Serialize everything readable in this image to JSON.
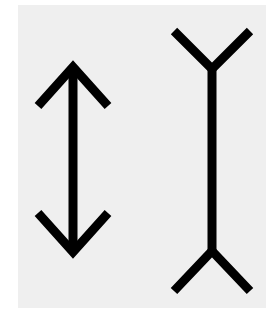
{
  "figure": {
    "background_color": "#efefef",
    "stroke_color": "#000000",
    "left_figure": {
      "type": "double-headed arrow (fins inward)"
    },
    "right_figure": {
      "type": "line with outward forked fins"
    }
  }
}
